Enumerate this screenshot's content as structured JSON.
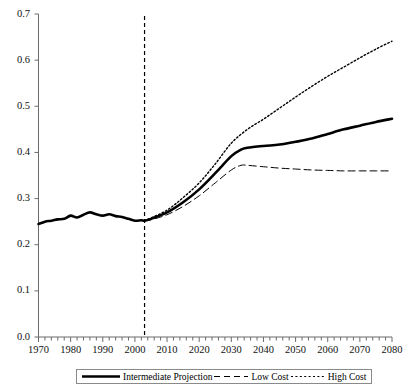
{
  "chart_data": {
    "type": "line",
    "title": "",
    "xlabel": "",
    "ylabel": "",
    "xlim": [
      1970,
      2080
    ],
    "ylim": [
      0.0,
      0.7
    ],
    "grid": false,
    "legend_position": "bottom",
    "xticks": [
      1970,
      1980,
      1990,
      2000,
      2010,
      2020,
      2030,
      2040,
      2050,
      2060,
      2070,
      2080
    ],
    "xtick_labels": [
      "1970",
      "1980",
      "1990",
      "2000",
      "2010",
      "2020",
      "2030",
      "2040",
      "2050",
      "2060",
      "2070",
      "2080"
    ],
    "xminor_step": 2,
    "yticks": [
      0.0,
      0.1,
      0.2,
      0.3,
      0.4,
      0.5,
      0.6,
      0.7
    ],
    "ytick_labels": [
      "0.0",
      "0.1",
      "0.2",
      "0.3",
      "0.4",
      "0.5",
      "0.6",
      "0.7"
    ],
    "annotations": [
      {
        "name": "history-projection-divider",
        "type": "vline",
        "x": 2003,
        "style": "dashed"
      }
    ],
    "series": [
      {
        "name": "Intermediate Projection",
        "style": "solid",
        "width": 2.6,
        "color": "#000000",
        "x": [
          1970,
          1972,
          1974,
          1976,
          1978,
          1980,
          1982,
          1984,
          1986,
          1988,
          1990,
          1992,
          1994,
          1996,
          1998,
          2000,
          2002,
          2003,
          2005,
          2010,
          2015,
          2020,
          2025,
          2030,
          2033,
          2035,
          2040,
          2045,
          2050,
          2055,
          2060,
          2065,
          2070,
          2075,
          2080
        ],
        "y": [
          0.245,
          0.25,
          0.252,
          0.255,
          0.256,
          0.263,
          0.259,
          0.265,
          0.27,
          0.266,
          0.263,
          0.266,
          0.262,
          0.26,
          0.256,
          0.252,
          0.253,
          0.252,
          0.256,
          0.27,
          0.292,
          0.32,
          0.355,
          0.392,
          0.406,
          0.41,
          0.414,
          0.417,
          0.423,
          0.43,
          0.44,
          0.45,
          0.458,
          0.466,
          0.473
        ]
      },
      {
        "name": "Low Cost",
        "style": "dashed",
        "width": 1.0,
        "color": "#000000",
        "x": [
          2003,
          2005,
          2010,
          2015,
          2020,
          2025,
          2030,
          2033,
          2035,
          2040,
          2045,
          2050,
          2055,
          2060,
          2065,
          2070,
          2075,
          2080
        ],
        "y": [
          0.252,
          0.254,
          0.265,
          0.283,
          0.306,
          0.334,
          0.362,
          0.372,
          0.372,
          0.369,
          0.366,
          0.364,
          0.362,
          0.361,
          0.36,
          0.36,
          0.36,
          0.36
        ]
      },
      {
        "name": "High Cost",
        "style": "dotted",
        "width": 1.4,
        "color": "#000000",
        "x": [
          2003,
          2005,
          2010,
          2015,
          2020,
          2025,
          2030,
          2035,
          2040,
          2045,
          2050,
          2055,
          2060,
          2065,
          2070,
          2075,
          2080
        ],
        "y": [
          0.253,
          0.258,
          0.275,
          0.302,
          0.334,
          0.375,
          0.42,
          0.45,
          0.472,
          0.496,
          0.52,
          0.543,
          0.565,
          0.585,
          0.605,
          0.624,
          0.641
        ]
      }
    ]
  },
  "legend": {
    "items": [
      {
        "label": "Intermediate Projection",
        "style": "solid"
      },
      {
        "label": "Low Cost",
        "style": "dashed"
      },
      {
        "label": "High Cost",
        "style": "dotted"
      }
    ]
  },
  "axes": {
    "y_labels": [
      "0.7",
      "0.6",
      "0.5",
      "0.4",
      "0.3",
      "0.2",
      "0.1",
      "0.0"
    ],
    "x_labels": [
      "1970",
      "1980",
      "1990",
      "2000",
      "2010",
      "2020",
      "2030",
      "2040",
      "2050",
      "2060",
      "2070",
      "2080"
    ]
  },
  "colors": {
    "line": "#000000",
    "axis": "#6b6b6b",
    "background": "#ffffff"
  }
}
